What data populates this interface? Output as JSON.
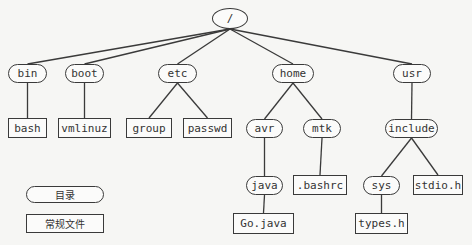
{
  "diagram": {
    "colors": {
      "stroke": "#3a3a3a",
      "background": "#f6f6f4",
      "node_fill": "#fbfbfa",
      "text": "#333333"
    },
    "nodes": [
      {
        "id": "root",
        "label": "/",
        "type": "root",
        "x": 212,
        "y": 8,
        "w": 36,
        "h": 21
      },
      {
        "id": "bin",
        "label": "bin",
        "type": "directory",
        "x": 8,
        "y": 64,
        "w": 39,
        "h": 19
      },
      {
        "id": "boot",
        "label": "boot",
        "type": "directory",
        "x": 65,
        "y": 64,
        "w": 39,
        "h": 19
      },
      {
        "id": "etc",
        "label": "etc",
        "type": "directory",
        "x": 158,
        "y": 64,
        "w": 39,
        "h": 19
      },
      {
        "id": "home",
        "label": "home",
        "type": "directory",
        "x": 272,
        "y": 64,
        "w": 42,
        "h": 19
      },
      {
        "id": "usr",
        "label": "usr",
        "type": "directory",
        "x": 393,
        "y": 64,
        "w": 38,
        "h": 19
      },
      {
        "id": "bash",
        "label": "bash",
        "type": "file",
        "x": 8,
        "y": 118,
        "w": 39,
        "h": 20
      },
      {
        "id": "vmlinuz",
        "label": "vmlinuz",
        "type": "file",
        "x": 58,
        "y": 118,
        "w": 53,
        "h": 20
      },
      {
        "id": "group",
        "label": "group",
        "type": "file",
        "x": 126,
        "y": 118,
        "w": 46,
        "h": 20
      },
      {
        "id": "passwd",
        "label": "passwd",
        "type": "file",
        "x": 183,
        "y": 118,
        "w": 49,
        "h": 20
      },
      {
        "id": "avr",
        "label": "avr",
        "type": "directory",
        "x": 246,
        "y": 119,
        "w": 37,
        "h": 19
      },
      {
        "id": "mtk",
        "label": "mtk",
        "type": "directory",
        "x": 303,
        "y": 119,
        "w": 38,
        "h": 19
      },
      {
        "id": "include",
        "label": "include",
        "type": "directory",
        "x": 385,
        "y": 119,
        "w": 53,
        "h": 19
      },
      {
        "id": "java",
        "label": "java",
        "type": "directory",
        "x": 246,
        "y": 176,
        "w": 37,
        "h": 19
      },
      {
        "id": "bashrc",
        "label": ".bashrc",
        "type": "file",
        "x": 293,
        "y": 175,
        "w": 54,
        "h": 20
      },
      {
        "id": "sys",
        "label": "sys",
        "type": "directory",
        "x": 363,
        "y": 176,
        "w": 37,
        "h": 19
      },
      {
        "id": "stdio_h",
        "label": "stdio.h",
        "type": "file",
        "x": 413,
        "y": 175,
        "w": 50,
        "h": 20
      },
      {
        "id": "go_java",
        "label": "Go.java",
        "type": "file",
        "x": 233,
        "y": 213,
        "w": 61,
        "h": 21
      },
      {
        "id": "types_h",
        "label": "types.h",
        "type": "file",
        "x": 355,
        "y": 213,
        "w": 53,
        "h": 21
      }
    ],
    "edges": [
      [
        "root",
        "bin"
      ],
      [
        "root",
        "boot"
      ],
      [
        "root",
        "etc"
      ],
      [
        "root",
        "home"
      ],
      [
        "root",
        "usr"
      ],
      [
        "bin",
        "bash"
      ],
      [
        "boot",
        "vmlinuz"
      ],
      [
        "etc",
        "group"
      ],
      [
        "etc",
        "passwd"
      ],
      [
        "home",
        "avr"
      ],
      [
        "home",
        "mtk"
      ],
      [
        "usr",
        "include"
      ],
      [
        "avr",
        "java"
      ],
      [
        "mtk",
        "bashrc"
      ],
      [
        "include",
        "sys"
      ],
      [
        "include",
        "stdio_h"
      ],
      [
        "java",
        "go_java"
      ],
      [
        "sys",
        "types_h"
      ]
    ],
    "legend": {
      "directory_label": "目录",
      "file_label": "常规文件"
    }
  }
}
